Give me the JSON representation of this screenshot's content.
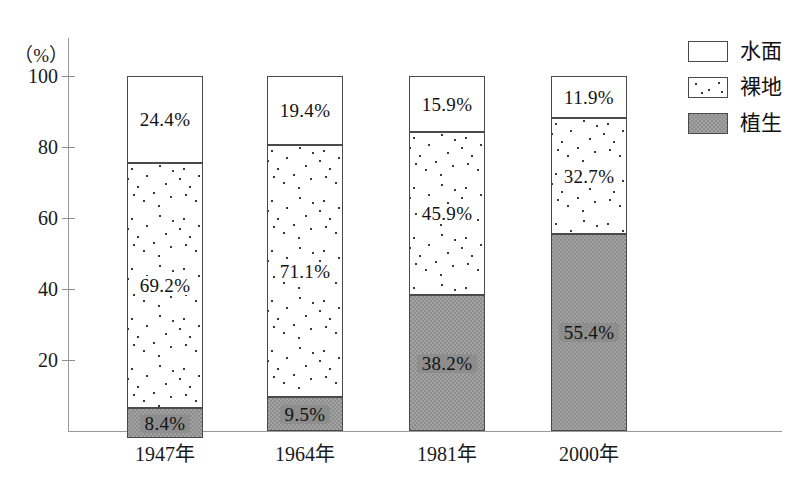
{
  "chart_data": {
    "type": "bar",
    "stacked": true,
    "title": "",
    "xlabel": "",
    "ylabel": "(%)",
    "ylim": [
      0,
      100
    ],
    "ytick_labels": [
      "20",
      "40",
      "60",
      "80",
      "100"
    ],
    "ytick_values": [
      20,
      40,
      60,
      80,
      100
    ],
    "grid": false,
    "legend_position": "top-right",
    "categories": [
      "1947年",
      "1964年",
      "1981年",
      "2000年"
    ],
    "series": [
      {
        "name": "水面",
        "key": "water",
        "fill": "white",
        "values": [
          24.4,
          19.4,
          15.9,
          11.9
        ],
        "labels": [
          "24.4%",
          "19.4%",
          "15.9%",
          "11.9%"
        ]
      },
      {
        "name": "裸地",
        "key": "bare",
        "fill": "stipple",
        "values": [
          69.2,
          71.1,
          45.9,
          32.7
        ],
        "labels": [
          "69.2%",
          "71.1%",
          "45.9%",
          "32.7%"
        ]
      },
      {
        "name": "植生",
        "key": "veg",
        "fill": "gray",
        "values": [
          8.4,
          9.5,
          38.2,
          55.4
        ],
        "labels": [
          "8.4%",
          "9.5%",
          "38.2%",
          "55.4%"
        ]
      }
    ]
  },
  "axis": {
    "unit_label": "（%）",
    "yticks": [
      {
        "label": "100",
        "value": 100
      },
      {
        "label": "80",
        "value": 80
      },
      {
        "label": "60",
        "value": 60
      },
      {
        "label": "40",
        "value": 40
      },
      {
        "label": "20",
        "value": 20
      }
    ],
    "categories": [
      "1947年",
      "1964年",
      "1981年",
      "2000年"
    ]
  },
  "legend": {
    "items": [
      {
        "label": "水面",
        "swatch": "white-box"
      },
      {
        "label": "裸地",
        "swatch": "stipple-box"
      },
      {
        "label": "植生",
        "swatch": "gray-box"
      }
    ]
  },
  "colors": {
    "vegetation_gray": "#8d8d8d",
    "outline": "#4a4a4a",
    "axis": "#9a9a9a",
    "text": "#1a1a1a",
    "background": "#ffffff"
  },
  "bars": [
    {
      "category": "1947年",
      "segments": [
        {
          "series": "水面",
          "value": 24.4,
          "label": "24.4%"
        },
        {
          "series": "裸地",
          "value": 69.2,
          "label": "69.2%"
        },
        {
          "series": "植生",
          "value": 8.4,
          "label": "8.4%"
        }
      ]
    },
    {
      "category": "1964年",
      "segments": [
        {
          "series": "水面",
          "value": 19.4,
          "label": "19.4%"
        },
        {
          "series": "裸地",
          "value": 71.1,
          "label": "71.1%"
        },
        {
          "series": "植生",
          "value": 9.5,
          "label": "9.5%"
        }
      ]
    },
    {
      "category": "1981年",
      "segments": [
        {
          "series": "水面",
          "value": 15.9,
          "label": "15.9%"
        },
        {
          "series": "裸地",
          "value": 45.9,
          "label": "45.9%"
        },
        {
          "series": "植生",
          "value": 38.2,
          "label": "38.2%"
        }
      ]
    },
    {
      "category": "2000年",
      "segments": [
        {
          "series": "水面",
          "value": 11.9,
          "label": "11.9%"
        },
        {
          "series": "裸地",
          "value": 32.7,
          "label": "32.7%"
        },
        {
          "series": "植生",
          "value": 55.4,
          "label": "55.4%"
        }
      ]
    }
  ]
}
